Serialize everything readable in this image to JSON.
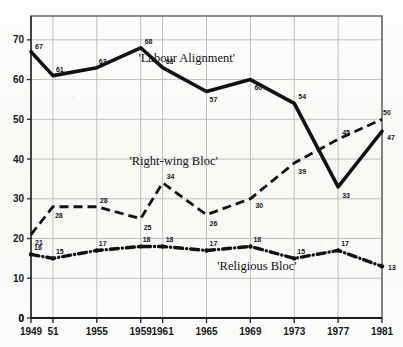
{
  "chart_data": {
    "type": "line",
    "title": "",
    "xlabel": "",
    "ylabel": "",
    "ylim": [
      0,
      76
    ],
    "yticks": [
      0,
      10,
      20,
      30,
      40,
      50,
      60,
      70
    ],
    "grid": true,
    "legend_position": "inline-annotations",
    "x": [
      1949,
      1951,
      1955,
      1959,
      1961,
      1965,
      1969,
      1973,
      1977,
      1981
    ],
    "xtick_labels": [
      "1949",
      "51",
      "1955",
      "1959",
      "1961",
      "1965",
      "1969",
      "1973",
      "1977",
      "1981"
    ],
    "series": [
      {
        "name": "'Labour Alignment'",
        "style": "solid-thick",
        "color": "#111213",
        "values": [
          67,
          61,
          63,
          68,
          63,
          57,
          60,
          54,
          33,
          47
        ],
        "labels": [
          "67",
          "61",
          "63",
          "68",
          "63",
          "57",
          "60",
          "54",
          "33",
          "47"
        ]
      },
      {
        "name": "'Right-wing Bloc'",
        "style": "dashed",
        "color": "#111213",
        "values": [
          21,
          28,
          28,
          25,
          34,
          26,
          30,
          39,
          45,
          50
        ],
        "labels": [
          "21",
          "28",
          "28",
          "25",
          "34",
          "26",
          "30",
          "39",
          "45",
          "50"
        ]
      },
      {
        "name": "'Religious Bloc'",
        "style": "dash-dot-thick",
        "color": "#111213",
        "values": [
          16,
          15,
          17,
          18,
          18,
          17,
          18,
          15,
          17,
          13
        ],
        "labels": [
          "16",
          "15",
          "17",
          "18",
          "18",
          "17",
          "18",
          "15",
          "17",
          "13"
        ]
      }
    ],
    "annotations": [
      {
        "text": "'Labour Alignment'",
        "x": 1963.2,
        "y": 64.5,
        "name": "labour-alignment-annotation"
      },
      {
        "text": "'Right-wing Bloc'",
        "x": 1962.0,
        "y": 38.6,
        "name": "right-wing-bloc-annotation"
      },
      {
        "text": "'Religious Bloc'",
        "x": 1969.6,
        "y": 12.2,
        "name": "religious-bloc-annotation"
      }
    ]
  },
  "colors": {
    "ink": "#111213",
    "grid": "#b8b9b5",
    "frame": "#5c5d5a",
    "paper": "#fbfbf9"
  }
}
